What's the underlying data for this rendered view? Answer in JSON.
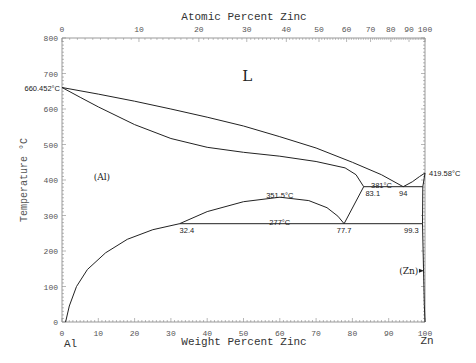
{
  "chart_data": {
    "type": "line",
    "title": "",
    "xlabel": "Weight Percent Zinc",
    "x2label": "Atomic Percent Zinc",
    "ylabel": "Temperature °C",
    "xlim": [
      0,
      100
    ],
    "ylim": [
      0,
      800
    ],
    "grid": false,
    "x_ticks": [
      0,
      10,
      20,
      30,
      40,
      50,
      60,
      70,
      80,
      90,
      100
    ],
    "y_ticks": [
      0,
      100,
      200,
      300,
      400,
      500,
      600,
      700,
      800
    ],
    "x2_ticks": [
      {
        "label": "0",
        "wt": 0
      },
      {
        "label": "10",
        "wt": 21.2
      },
      {
        "label": "20",
        "wt": 37.7
      },
      {
        "label": "30",
        "wt": 50.9
      },
      {
        "label": "40",
        "wt": 61.8
      },
      {
        "label": "50",
        "wt": 70.8
      },
      {
        "label": "60",
        "wt": 78.4
      },
      {
        "label": "70",
        "wt": 85.0
      },
      {
        "label": "80",
        "wt": 90.6
      },
      {
        "label": "90",
        "wt": 95.6
      },
      {
        "label": "100",
        "wt": 100
      }
    ],
    "end_labels": {
      "left": "Al",
      "right": "Zn"
    },
    "series": [
      {
        "name": "liquidus",
        "points": [
          [
            0,
            660.452
          ],
          [
            10,
            642
          ],
          [
            20,
            622
          ],
          [
            30,
            600
          ],
          [
            40,
            577
          ],
          [
            50,
            552
          ],
          [
            60,
            522
          ],
          [
            70,
            490
          ],
          [
            80,
            450
          ],
          [
            88,
            415
          ],
          [
            94,
            381
          ],
          [
            96.5,
            395
          ],
          [
            98.5,
            410
          ],
          [
            100,
            419.58
          ]
        ]
      },
      {
        "name": "solidus-al",
        "points": [
          [
            0,
            660.452
          ],
          [
            5,
            633
          ],
          [
            10,
            606
          ],
          [
            20,
            556
          ],
          [
            30,
            517
          ],
          [
            40,
            492
          ],
          [
            50,
            478
          ],
          [
            60,
            467
          ],
          [
            70,
            452
          ],
          [
            78,
            434
          ],
          [
            81,
            415
          ],
          [
            83.1,
            381
          ]
        ]
      },
      {
        "name": "miscibility-gap",
        "points": [
          [
            32.4,
            277
          ],
          [
            40,
            311
          ],
          [
            50,
            339
          ],
          [
            60,
            351.5
          ],
          [
            68,
            342
          ],
          [
            73,
            322
          ],
          [
            76,
            298
          ],
          [
            77.7,
            277
          ]
        ]
      },
      {
        "name": "solvus-al",
        "points": [
          [
            1.0,
            0
          ],
          [
            2,
            45
          ],
          [
            4,
            100
          ],
          [
            7,
            148
          ],
          [
            12,
            195
          ],
          [
            18,
            233
          ],
          [
            25,
            260
          ],
          [
            32.4,
            277
          ]
        ]
      },
      {
        "name": "monotectoid-boundary",
        "points": [
          [
            77.7,
            277
          ],
          [
            83.1,
            381
          ]
        ]
      },
      {
        "name": "eutectic-line",
        "points": [
          [
            83.1,
            381
          ],
          [
            99.4,
            381
          ]
        ]
      },
      {
        "name": "eutectoid-line",
        "points": [
          [
            32.4,
            277
          ],
          [
            99.3,
            277
          ]
        ]
      },
      {
        "name": "solvus-zn",
        "points": [
          [
            100,
            419.58
          ],
          [
            99.4,
            381
          ],
          [
            99.3,
            277
          ],
          [
            99.6,
            150
          ],
          [
            99.8,
            50
          ],
          [
            100,
            0
          ]
        ]
      }
    ],
    "annotations": [
      {
        "text": "660.452°C",
        "x": 0,
        "y": 660.452,
        "anchor": "end"
      },
      {
        "text": "419.58°C",
        "x": 100,
        "y": 419.58,
        "anchor": "start"
      },
      {
        "text": "381°C",
        "x": 88,
        "y": 387,
        "anchor": "middle"
      },
      {
        "text": "83.1",
        "x": 83.6,
        "y": 362,
        "anchor": "start"
      },
      {
        "text": "94",
        "x": 94,
        "y": 362,
        "anchor": "middle"
      },
      {
        "text": "351.5°C",
        "x": 60,
        "y": 358,
        "anchor": "middle"
      },
      {
        "text": "277°C",
        "x": 60,
        "y": 283,
        "anchor": "middle"
      },
      {
        "text": "32.4",
        "x": 32.4,
        "y": 258,
        "anchor": "start"
      },
      {
        "text": "77.7",
        "x": 77.7,
        "y": 258,
        "anchor": "middle"
      },
      {
        "text": "99.3",
        "x": 98.8,
        "y": 258,
        "anchor": "end"
      }
    ],
    "phase_labels": [
      {
        "text": "L",
        "x": 51,
        "y": 680
      },
      {
        "text": "(Al)",
        "x": 11,
        "y": 400
      },
      {
        "text": "(Zn)",
        "x": 95.5,
        "y": 136
      }
    ]
  }
}
